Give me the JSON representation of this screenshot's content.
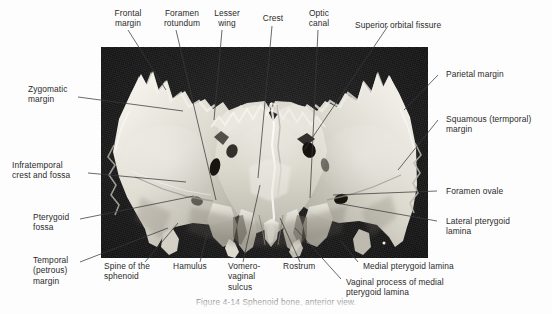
{
  "figure": {
    "title": "Sphenoid bone, anterior view",
    "specimen": "sphenoid-bone-photograph",
    "plate_background_color": "#191919",
    "bone_color": "#e9e7e0",
    "leader_line_color": "#3a3a3a",
    "text_color": "#2b2b2b",
    "caption": "Figure 4-14  Sphenoid bone, anterior view."
  },
  "labels": [
    {
      "id": "frontal-margin",
      "text": "Frontal\nmargin"
    },
    {
      "id": "foramen-rotundum",
      "text": "Foramen\nrotundum"
    },
    {
      "id": "lesser-wing",
      "text": "Lesser\nwing"
    },
    {
      "id": "crest",
      "text": "Crest"
    },
    {
      "id": "optic-canal",
      "text": "Optic\ncanal"
    },
    {
      "id": "superior-orbital-fissure",
      "text": "Superior orbital fissure"
    },
    {
      "id": "parietal-margin",
      "text": "Parietal margin"
    },
    {
      "id": "squamous-temporal-margin",
      "text": "Squamous (termporal)\nmargin"
    },
    {
      "id": "foramen-ovale",
      "text": "Foramen ovale"
    },
    {
      "id": "lateral-pterygoid-lamina",
      "text": "Lateral pterygoid\nlamina"
    },
    {
      "id": "medial-pterygoid-lamina",
      "text": "Medial pterygoid lamina"
    },
    {
      "id": "vaginal-process",
      "text": "Vaginal process of medial\npterygoid lamina"
    },
    {
      "id": "rostrum",
      "text": "Rostrum"
    },
    {
      "id": "vomero-vaginal-sulcus",
      "text": "Vomero-\nvaginal\nsulcus"
    },
    {
      "id": "hamulus",
      "text": "Hamulus"
    },
    {
      "id": "spine-of-the-sphenoid",
      "text": "Spine of the\nsphenoid"
    },
    {
      "id": "temporal-petrous-margin",
      "text": "Temporal\n(petrous)\nmargin"
    },
    {
      "id": "pterygoid-fossa",
      "text": "Pterygoid\nfossa"
    },
    {
      "id": "infratemporal-crest",
      "text": "Infratemporal\ncrest and fossa"
    },
    {
      "id": "zygomatic-margin",
      "text": "Zygomatic\nmargin"
    }
  ]
}
